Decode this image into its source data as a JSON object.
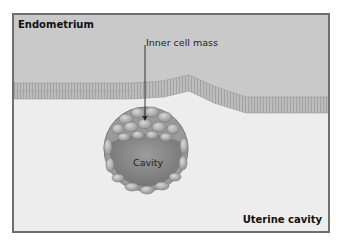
{
  "diagram": {
    "type": "biology illustration",
    "labels": {
      "endometrium": "Endometrium",
      "inner_cell_mass": "Inner cell mass",
      "cavity": "Cavity",
      "uterine_cavity": "Uterine cavity"
    },
    "colors": {
      "endometrium": "#c9c9c9",
      "uterine_cavity": "#ededed",
      "frame_border": "#6f6f6f",
      "epithelium": "#b5b5b5",
      "blastocyst_cells": "#a8a8a8",
      "cavity_fill": "#8c8c8c"
    }
  }
}
